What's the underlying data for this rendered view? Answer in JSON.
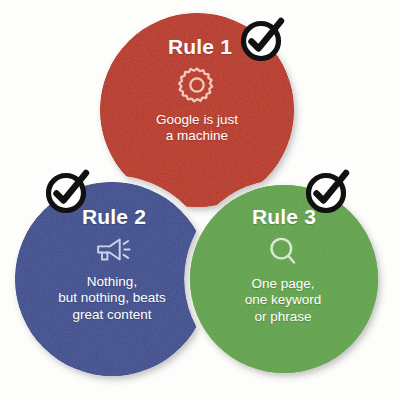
{
  "graphic": {
    "type": "three-circle-rules-infographic",
    "background_color": "#fdfdfc"
  },
  "rules": [
    {
      "id": "rule-1",
      "title": "Rule 1",
      "icon": "gear-icon",
      "color": "#b9351f",
      "text_color": "#ffffff",
      "lines": [
        "Google is just",
        "a machine"
      ],
      "check": {
        "name": "check-badge-rule-1",
        "color": "#111111",
        "fill": "#ffffff"
      }
    },
    {
      "id": "rule-2",
      "title": "Rule 2",
      "icon": "megaphone-icon",
      "color": "#3c4d8f",
      "text_color": "#ffffff",
      "lines": [
        "Nothing,",
        "but nothing, beats",
        "great content"
      ],
      "check": {
        "name": "check-badge-rule-2",
        "color": "#111111",
        "fill": "#ffffff"
      }
    },
    {
      "id": "rule-3",
      "title": "Rule 3",
      "icon": "magnifier-icon",
      "color": "#61a44a",
      "text_color": "#ffffff",
      "lines": [
        "One page,",
        "one keyword",
        "or phrase"
      ],
      "check": {
        "name": "check-badge-rule-3",
        "color": "#111111",
        "fill": "#ffffff"
      }
    }
  ],
  "colors": {
    "red": "#b9351f",
    "blue": "#3c4d8f",
    "green": "#61a44a",
    "check_ring": "#111111",
    "check_fill": "#ffffff",
    "separator": "#ffffff"
  }
}
